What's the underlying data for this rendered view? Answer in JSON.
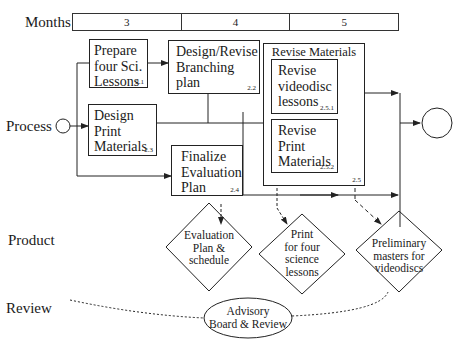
{
  "diagram": {
    "timeline": {
      "label": "Months",
      "months": [
        "3",
        "4",
        "5"
      ]
    },
    "row_labels": {
      "process": "Process",
      "product": "Product",
      "review": "Review"
    },
    "tasks": [
      {
        "id": "2.1",
        "text": "Prepare\nfour Sci.\nLessons",
        "number": "2.1"
      },
      {
        "id": "2.2",
        "text": "Design/Revise\nBranching\nplan",
        "number": "2.2"
      },
      {
        "id": "2.3",
        "text": "Design\nPrint\nMaterials",
        "number": "2.3"
      },
      {
        "id": "2.4",
        "text": "Finalize\nEvaluation\nPlan",
        "number": "2.4"
      }
    ],
    "group": {
      "title": "Revise Materials",
      "number": "2.5",
      "subtasks": [
        {
          "id": "2.5.1",
          "text": "Revise\nvideodisc\nlessons",
          "number": "2.5.1"
        },
        {
          "id": "2.5.2",
          "text": "Revise\nPrint\nMaterials",
          "number": "2.5.2"
        }
      ]
    },
    "products": [
      {
        "text": "Evaluation\nPlan &\nschedule"
      },
      {
        "text": "Print\nfor four\nscience\nlessons"
      },
      {
        "text": "Preliminary\nmasters for\nvideodiscs"
      }
    ],
    "review_node": {
      "text": "Advisory\nBoard & Review"
    },
    "colors": {
      "line": "#222222",
      "background": "#ffffff"
    }
  }
}
